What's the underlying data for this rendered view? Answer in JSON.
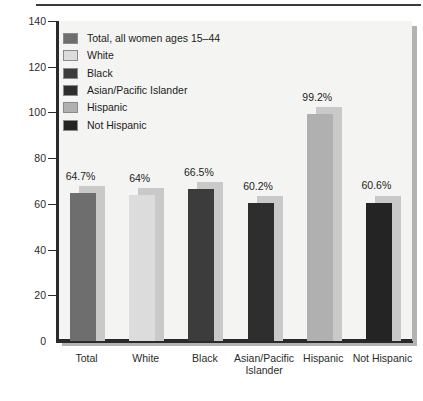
{
  "chart_data": {
    "type": "bar",
    "title": "",
    "xlabel": "",
    "ylabel": "",
    "ylim": [
      0,
      140
    ],
    "yticks": [
      0,
      20,
      40,
      60,
      80,
      100,
      120,
      140
    ],
    "grid": false,
    "legend_position": "upper-left",
    "categories": [
      "Total",
      "White",
      "Black",
      "Asian/Pacific Islander",
      "Hispanic",
      "Not Hispanic"
    ],
    "values": [
      64.7,
      64,
      66.5,
      60.2,
      99.2,
      60.6
    ],
    "data_labels": [
      "64.7%",
      "64%",
      "66.5%",
      "60.2%",
      "99.2%",
      "60.6%"
    ],
    "legend": [
      {
        "label": "Total, all women ages 15–44",
        "color": "#6e6e6e"
      },
      {
        "label": "White",
        "color": "#dcdcdc"
      },
      {
        "label": "Black",
        "color": "#3c3c3c"
      },
      {
        "label": "Asian/Pacific Islander",
        "color": "#2e2e2e"
      },
      {
        "label": "Hispanic",
        "color": "#b0b0b0"
      },
      {
        "label": "Not Hispanic",
        "color": "#242424"
      }
    ],
    "bar_colors": [
      "#6e6e6e",
      "#dcdcdc",
      "#3c3c3c",
      "#2e2e2e",
      "#b0b0b0",
      "#242424"
    ],
    "xtick_labels": [
      [
        "Total",
        ""
      ],
      [
        "White",
        ""
      ],
      [
        "Black",
        ""
      ],
      [
        "Asian/Pacific",
        "Islander"
      ],
      [
        "Hispanic",
        ""
      ],
      [
        "Not Hispanic",
        ""
      ]
    ]
  },
  "axis": {
    "y_tick_labels": [
      "140",
      "120",
      "100",
      "80",
      "60",
      "40",
      "20",
      "0"
    ]
  },
  "colors": {
    "plot_background": "#f4f4f2",
    "plot_shadow": "#b3b3b3",
    "axis": "#2a2a2a",
    "bar_shadow": "#c9c9c9",
    "text": "#1c1c1c"
  }
}
